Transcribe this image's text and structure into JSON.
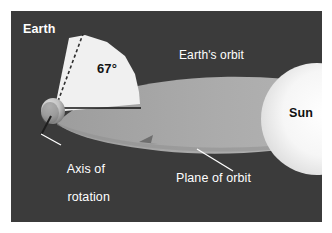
{
  "figure": {
    "kind": "astronomy-diagram",
    "background_color": "#ffffff",
    "panel_color": "#3b3b3b"
  },
  "labels": {
    "earth": "Earth",
    "angle": "67°",
    "earths_orbit": "Earth's orbit",
    "sun": "Sun",
    "axis_of_rotation_line1": "Axis of",
    "axis_of_rotation_line2": "rotation",
    "plane_of_orbit": "Plane of orbit"
  },
  "colors": {
    "space_background": "#3b3b3b",
    "orbit_plane": "#a8a8a8",
    "angle_wedge": "#f0f0f0",
    "sun": "#f4f4f4",
    "earth_globe": "#c9c9c9",
    "label_text": "#ffffff",
    "dark_label_text": "#111111",
    "leader_line": "#ffffff",
    "baseline": "#1a1a1a",
    "axis_dashed": "#2a2a2a"
  },
  "measurements": {
    "tilt_angle_degrees": 67,
    "tilt_angle_text": "67°"
  },
  "elements": {
    "earth_globe": "small shaded sphere at the vertex of the angle",
    "sun_disc": "large pale disc at the right edge",
    "axis_line": "dashed line from the globe up through the wedge",
    "baseline": "horizontal solid line through the globe along the orbital plane",
    "orbit_arrow": "arrowhead on the near edge of the orbital plane indicating direction of travel"
  }
}
